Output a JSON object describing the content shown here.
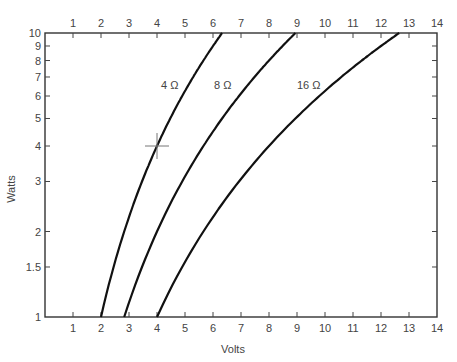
{
  "chart_data": {
    "type": "line",
    "title": "",
    "xlabel": "Volts",
    "ylabel": "Watts",
    "xlim": [
      0,
      14
    ],
    "ylim": [
      1,
      10
    ],
    "yscale": "log",
    "grid": false,
    "x_ticks": [
      "1",
      "2",
      "3",
      "4",
      "5",
      "6",
      "7",
      "8",
      "9",
      "10",
      "11",
      "12",
      "13",
      "14"
    ],
    "x_ticks_top": [
      "1",
      "2",
      "3",
      "4",
      "5",
      "6",
      "7",
      "8",
      "9",
      "10",
      "11",
      "12",
      "13",
      "14"
    ],
    "y_ticks": [
      "1",
      "1.5",
      "2",
      "3",
      "4",
      "5",
      "6",
      "7",
      "8",
      "9",
      "10"
    ],
    "y_tick_values": [
      1,
      1.5,
      2,
      3,
      4,
      5,
      6,
      7,
      8,
      9,
      10
    ],
    "series": [
      {
        "name": "4 Ω",
        "resistance": 4,
        "x": [
          2.0,
          2.45,
          2.83,
          3.46,
          4.0,
          4.47,
          4.9,
          5.29,
          5.66,
          6.0,
          6.32
        ],
        "y": [
          1,
          1.5,
          2,
          3,
          4,
          5,
          6,
          7,
          8,
          9,
          10
        ]
      },
      {
        "name": "8 Ω",
        "resistance": 8,
        "x": [
          2.83,
          3.46,
          4.0,
          4.9,
          5.66,
          6.32,
          6.93,
          7.48,
          8.0,
          8.49,
          8.94
        ],
        "y": [
          1,
          1.5,
          2,
          3,
          4,
          5,
          6,
          7,
          8,
          9,
          10
        ]
      },
      {
        "name": "16 Ω",
        "resistance": 16,
        "x": [
          4.0,
          4.9,
          5.66,
          6.93,
          8.0,
          8.94,
          9.8,
          10.58,
          11.31,
          12.0,
          12.65
        ],
        "y": [
          1,
          1.5,
          2,
          3,
          4,
          5,
          6,
          7,
          8,
          9,
          10
        ]
      }
    ],
    "annotations": [
      {
        "type": "crosshair-marker",
        "x": 4,
        "y": 4
      }
    ]
  },
  "labels": {
    "xlabel": "Volts",
    "ylabel": "Watts",
    "curve_4": "4 Ω",
    "curve_8": "8 Ω",
    "curve_16": "16 Ω"
  }
}
